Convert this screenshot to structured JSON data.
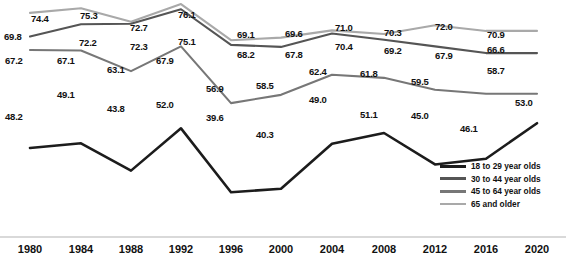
{
  "chart_data": {
    "type": "line",
    "title": "",
    "subtitle": "",
    "xlabel": "",
    "ylabel": "",
    "grid": false,
    "legend_position": "bottom-right",
    "axis_visible": {
      "x": true,
      "y": false
    },
    "ylim": [
      35,
      80
    ],
    "categories": [
      "1980",
      "1984",
      "1988",
      "1992",
      "1996",
      "2000",
      "2004",
      "2008",
      "2012",
      "2016",
      "2020"
    ],
    "series": [
      {
        "name": "18 to 29 year olds",
        "color": "#1c1c1c",
        "values": [
          48.2,
          49.1,
          43.8,
          52.0,
          39.6,
          40.3,
          49.0,
          51.1,
          45.0,
          46.1,
          53.0
        ],
        "label_positions": [
          "below",
          "above",
          "above",
          "above",
          "above",
          "below",
          "above",
          "below",
          "above",
          "below",
          "below"
        ]
      },
      {
        "name": "30 to 44 year olds",
        "color": "#555555",
        "values": [
          69.8,
          72.2,
          72.3,
          75.1,
          68.2,
          67.8,
          70.4,
          69.2,
          67.9,
          66.6,
          66.6
        ],
        "label_positions": [
          "below",
          "below",
          "below",
          "below",
          "below",
          "below",
          "below",
          "below",
          "below",
          "right",
          "right"
        ]
      },
      {
        "name": "45 to 64 year olds",
        "color": "#777777",
        "values": [
          67.2,
          67.1,
          63.1,
          67.9,
          56.9,
          58.5,
          62.4,
          61.8,
          59.5,
          58.7,
          58.7
        ],
        "label_positions": [
          "below",
          "below",
          "below",
          "below",
          "below",
          "below",
          "below",
          "below",
          "below",
          "right",
          "right"
        ]
      },
      {
        "name": "65 and older",
        "color": "#a9a9a9",
        "values": [
          74.4,
          75.3,
          72.7,
          76.1,
          69.1,
          69.6,
          71.0,
          70.3,
          72.0,
          70.9,
          70.9
        ],
        "label_positions": [
          "above",
          "above",
          "above",
          "above",
          "above",
          "above",
          "above",
          "above",
          "above",
          "right",
          "right"
        ]
      }
    ],
    "point_labels": [
      {
        "text": "74.4",
        "x": 31,
        "y": 13
      },
      {
        "text": "75.3",
        "x": 80,
        "y": 10
      },
      {
        "text": "72.7",
        "x": 130,
        "y": 22
      },
      {
        "text": "76.1",
        "x": 178,
        "y": 9
      },
      {
        "text": "69.1",
        "x": 237,
        "y": 29
      },
      {
        "text": "69.6",
        "x": 285,
        "y": 28
      },
      {
        "text": "71.0",
        "x": 335,
        "y": 22
      },
      {
        "text": "70.3",
        "x": 384,
        "y": 27
      },
      {
        "text": "72.0",
        "x": 435,
        "y": 21
      },
      {
        "text": "70.9",
        "x": 487,
        "y": 29
      },
      {
        "text": "69.8",
        "x": 4,
        "y": 31
      },
      {
        "text": "72.2",
        "x": 79,
        "y": 37
      },
      {
        "text": "72.3",
        "x": 130,
        "y": 41
      },
      {
        "text": "75.1",
        "x": 178,
        "y": 36
      },
      {
        "text": "68.2",
        "x": 237,
        "y": 49
      },
      {
        "text": "67.8",
        "x": 285,
        "y": 49
      },
      {
        "text": "70.4",
        "x": 335,
        "y": 41
      },
      {
        "text": "69.2",
        "x": 384,
        "y": 45
      },
      {
        "text": "67.9",
        "x": 435,
        "y": 50
      },
      {
        "text": "66.6",
        "x": 487,
        "y": 44
      },
      {
        "text": "67.2",
        "x": 5,
        "y": 55
      },
      {
        "text": "67.1",
        "x": 57,
        "y": 55
      },
      {
        "text": "63.1",
        "x": 107,
        "y": 64
      },
      {
        "text": "67.9",
        "x": 156,
        "y": 55
      },
      {
        "text": "56.9",
        "x": 206,
        "y": 83
      },
      {
        "text": "58.5",
        "x": 256,
        "y": 80
      },
      {
        "text": "62.4",
        "x": 309,
        "y": 66
      },
      {
        "text": "61.8",
        "x": 360,
        "y": 68
      },
      {
        "text": "59.5",
        "x": 411,
        "y": 76
      },
      {
        "text": "58.7",
        "x": 487,
        "y": 65
      },
      {
        "text": "48.2",
        "x": 5,
        "y": 111
      },
      {
        "text": "49.1",
        "x": 57,
        "y": 89
      },
      {
        "text": "43.8",
        "x": 107,
        "y": 103
      },
      {
        "text": "52.0",
        "x": 156,
        "y": 99
      },
      {
        "text": "39.6",
        "x": 206,
        "y": 112
      },
      {
        "text": "40.3",
        "x": 256,
        "y": 129
      },
      {
        "text": "49.0",
        "x": 309,
        "y": 94
      },
      {
        "text": "51.1",
        "x": 360,
        "y": 109
      },
      {
        "text": "45.0",
        "x": 411,
        "y": 110
      },
      {
        "text": "46.1",
        "x": 460,
        "y": 123
      },
      {
        "text": "53.0",
        "x": 515,
        "y": 97
      }
    ]
  },
  "legend": {
    "items": [
      {
        "label": "18 to 29 year olds",
        "color": "#1c1c1c"
      },
      {
        "label": "30 to 44 year olds",
        "color": "#555555"
      },
      {
        "label": "45 to 64 year olds",
        "color": "#777777"
      },
      {
        "label": "65 and older",
        "color": "#a9a9a9"
      }
    ]
  },
  "xaxis": {
    "ticks": [
      {
        "label": "1980",
        "x": 30
      },
      {
        "label": "1984",
        "x": 81
      },
      {
        "label": "1988",
        "x": 131
      },
      {
        "label": "1992",
        "x": 181
      },
      {
        "label": "1996",
        "x": 231
      },
      {
        "label": "2000",
        "x": 281
      },
      {
        "label": "2004",
        "x": 332
      },
      {
        "label": "2008",
        "x": 384
      },
      {
        "label": "2012",
        "x": 435
      },
      {
        "label": "2016",
        "x": 486
      },
      {
        "label": "2020",
        "x": 537
      }
    ]
  }
}
